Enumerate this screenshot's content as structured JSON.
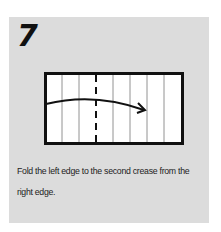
{
  "step": {
    "number": "7",
    "caption": "Fold the left edge to the second crease from the right edge."
  },
  "diagram": {
    "paper_color": "#ffffff",
    "border_color": "#111111",
    "crease_count": 7,
    "dashed_valley_fold_after_crease": 2,
    "arrow": "curved arrow from left edge to second crease from right edge"
  },
  "colors": {
    "panel_background": "#dcdcdc",
    "text": "#222222"
  }
}
